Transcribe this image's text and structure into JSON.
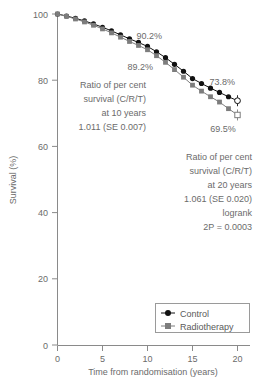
{
  "chart_data": {
    "type": "line",
    "title": "",
    "xlabel": "Time from randomisation (years)",
    "ylabel": "Survival (%)",
    "xlim": [
      0,
      20
    ],
    "ylim": [
      0,
      100
    ],
    "xticks": [
      0,
      5,
      10,
      15,
      20
    ],
    "yticks": [
      0,
      20,
      40,
      60,
      80,
      100
    ],
    "grid": false,
    "legend_position": "bottom-right",
    "x": [
      0,
      1,
      2,
      3,
      4,
      5,
      6,
      7,
      8,
      9,
      10,
      11,
      12,
      13,
      14,
      15,
      16,
      17,
      18,
      19,
      20
    ],
    "series": [
      {
        "name": "Control",
        "marker": "filled-circle",
        "color": "#111111",
        "values": [
          100.0,
          99.4,
          98.7,
          97.9,
          97.0,
          96.0,
          94.9,
          93.7,
          92.5,
          91.4,
          90.2,
          88.6,
          86.8,
          84.8,
          82.7,
          80.5,
          79.0,
          77.6,
          76.3,
          75.0,
          73.8
        ]
      },
      {
        "name": "Radiotherapy",
        "marker": "filled-square",
        "color": "#7d7d7d",
        "values": [
          100.0,
          99.3,
          98.5,
          97.6,
          96.6,
          95.5,
          94.3,
          93.0,
          91.7,
          90.5,
          89.2,
          87.4,
          85.4,
          83.2,
          80.9,
          78.5,
          76.7,
          75.0,
          73.4,
          71.4,
          69.5
        ]
      }
    ],
    "endpoint_markers": [
      {
        "series": "Control",
        "x": 20,
        "y": 73.8,
        "marker": "open-circle",
        "error_bar": true
      },
      {
        "series": "Radiotherapy",
        "x": 20,
        "y": 69.5,
        "marker": "open-square",
        "error_bar": true
      }
    ],
    "annotations": [
      {
        "name": "control-10y",
        "text": "90.2%",
        "x": 10.2,
        "y": 92.5
      },
      {
        "name": "rt-10y",
        "text": "89.2%",
        "x": 9.2,
        "y": 83.0
      },
      {
        "name": "control-20y",
        "text": "73.8%",
        "x": 18.3,
        "y": 78.5
      },
      {
        "name": "rt-20y",
        "text": "69.5%",
        "x": 18.4,
        "y": 64.5
      }
    ]
  },
  "axes": {
    "y_title": "Survival (%)",
    "x_title": "Time from randomisation (years)",
    "y_tick_labels": [
      "100",
      "80",
      "60",
      "40",
      "20",
      "0"
    ],
    "x_tick_labels": [
      "0",
      "5",
      "10",
      "15",
      "20"
    ]
  },
  "point_labels": {
    "control_10y": "90.2%",
    "rt_10y": "89.2%",
    "control_20y": "73.8%",
    "rt_20y": "69.5%"
  },
  "annotation_10y": {
    "line1": "Ratio of per cent",
    "line2": "survival (C/R/T)",
    "line3": "at 10 years",
    "line4": "1.011 (SE 0.007)"
  },
  "annotation_20y": {
    "line1": "Ratio of per cent",
    "line2": "survival (C/R/T)",
    "line3": "at 20 years",
    "line4": "1.061 (SE 0.020)",
    "line5": "logrank",
    "line6": "2P = 0.0003"
  },
  "legend": {
    "items": [
      {
        "label": "Control",
        "marker": "filled-circle",
        "color": "#111111"
      },
      {
        "label": "Radiotherapy",
        "marker": "filled-square",
        "color": "#7d7d7d"
      }
    ]
  }
}
